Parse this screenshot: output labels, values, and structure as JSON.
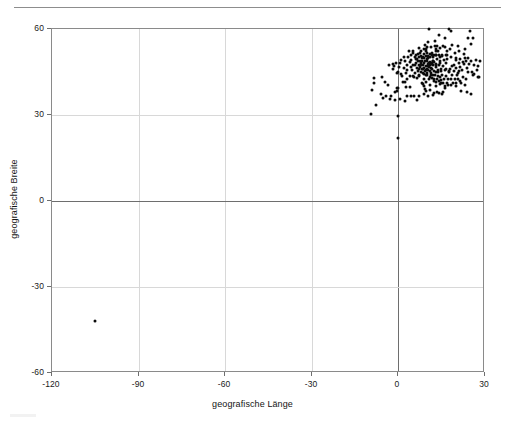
{
  "chart_data": {
    "type": "scatter",
    "title": "",
    "xlabel": "geografische Länge",
    "ylabel": "geografische Breite",
    "xlim": [
      -120,
      30
    ],
    "ylim": [
      -60,
      60
    ],
    "xticks": [
      -120,
      -90,
      -60,
      -30,
      0,
      30
    ],
    "yticks": [
      -60,
      -30,
      0,
      30,
      60
    ],
    "xticklabels": [
      "-120",
      "-90",
      "-60",
      "-30",
      "0",
      "30"
    ],
    "yticklabels": [
      "-60",
      "-30",
      "0",
      "30",
      "60"
    ],
    "grid": true,
    "legend": null,
    "marker": {
      "shape": "circle",
      "color": "#0b0b0b",
      "size": 3
    },
    "series": [
      {
        "name": "Fundorte",
        "points": [
          [
            -105.0,
            -42.0
          ],
          [
            0.0,
            29.5
          ],
          [
            0.0,
            22.0
          ],
          [
            26.0,
            57.0
          ],
          [
            3.5,
            52.3
          ],
          [
            13.0,
            52.5
          ],
          [
            12.3,
            51.0
          ],
          [
            11.0,
            50.2
          ],
          [
            9.5,
            50.6
          ],
          [
            8.6,
            50.1
          ],
          [
            10.0,
            49.5
          ],
          [
            12.0,
            49.0
          ],
          [
            14.4,
            50.1
          ],
          [
            7.6,
            49.0
          ],
          [
            8.2,
            48.8
          ],
          [
            6.1,
            49.6
          ],
          [
            9.2,
            48.8
          ],
          [
            10.9,
            48.4
          ],
          [
            11.6,
            48.1
          ],
          [
            13.0,
            47.8
          ],
          [
            14.3,
            48.2
          ],
          [
            16.4,
            48.2
          ],
          [
            15.4,
            47.1
          ],
          [
            8.5,
            47.4
          ],
          [
            7.4,
            46.9
          ],
          [
            6.6,
            46.5
          ],
          [
            9.0,
            46.5
          ],
          [
            11.3,
            46.5
          ],
          [
            12.3,
            45.4
          ],
          [
            9.2,
            45.5
          ],
          [
            7.7,
            45.1
          ],
          [
            10.0,
            44.5
          ],
          [
            11.3,
            44.5
          ],
          [
            12.6,
            43.8
          ],
          [
            11.3,
            43.8
          ],
          [
            9.4,
            44.1
          ],
          [
            8.9,
            44.4
          ],
          [
            13.8,
            45.1
          ],
          [
            16.0,
            45.8
          ],
          [
            17.6,
            44.9
          ],
          [
            18.4,
            43.9
          ],
          [
            19.2,
            45.2
          ],
          [
            20.5,
            44.8
          ],
          [
            21.0,
            45.3
          ],
          [
            22.0,
            45.8
          ],
          [
            23.6,
            46.5
          ],
          [
            24.0,
            45.0
          ],
          [
            25.6,
            45.0
          ],
          [
            26.1,
            44.4
          ],
          [
            23.3,
            42.7
          ],
          [
            21.4,
            42.0
          ],
          [
            19.8,
            41.3
          ],
          [
            21.7,
            41.1
          ],
          [
            22.9,
            40.6
          ],
          [
            23.7,
            37.9
          ],
          [
            21.7,
            38.2
          ],
          [
            25.3,
            37.4
          ],
          [
            14.3,
            40.8
          ],
          [
            15.6,
            41.1
          ],
          [
            16.9,
            41.1
          ],
          [
            12.5,
            41.9
          ],
          [
            13.4,
            42.4
          ],
          [
            14.2,
            42.0
          ],
          [
            15.1,
            37.5
          ],
          [
            13.4,
            38.1
          ],
          [
            12.5,
            37.8
          ],
          [
            9.1,
            39.2
          ],
          [
            8.6,
            40.7
          ],
          [
            4.0,
            39.9
          ],
          [
            2.6,
            39.6
          ],
          [
            0.0,
            39.5
          ],
          [
            -0.4,
            39.5
          ],
          [
            -1.1,
            38.0
          ],
          [
            -3.7,
            40.4
          ],
          [
            -4.7,
            41.6
          ],
          [
            -5.7,
            43.4
          ],
          [
            -8.5,
            42.9
          ],
          [
            -8.6,
            41.2
          ],
          [
            -9.1,
            38.7
          ],
          [
            -6.0,
            37.4
          ],
          [
            -4.4,
            36.7
          ],
          [
            -2.5,
            36.8
          ],
          [
            -0.5,
            38.3
          ],
          [
            1.5,
            41.4
          ],
          [
            2.2,
            41.4
          ],
          [
            3.1,
            42.5
          ],
          [
            1.4,
            43.6
          ],
          [
            -0.6,
            44.8
          ],
          [
            0.3,
            46.6
          ],
          [
            -1.6,
            47.2
          ],
          [
            2.3,
            48.9
          ],
          [
            4.8,
            45.8
          ],
          [
            5.4,
            43.3
          ],
          [
            7.3,
            43.7
          ],
          [
            4.4,
            50.8
          ],
          [
            4.9,
            52.4
          ],
          [
            5.1,
            51.6
          ],
          [
            6.8,
            51.2
          ],
          [
            7.6,
            51.5
          ],
          [
            6.0,
            50.8
          ],
          [
            8.7,
            51.3
          ],
          [
            9.7,
            52.4
          ],
          [
            10.0,
            53.6
          ],
          [
            11.4,
            53.6
          ],
          [
            12.6,
            54.1
          ],
          [
            13.4,
            54.1
          ],
          [
            8.8,
            53.1
          ],
          [
            7.2,
            53.5
          ],
          [
            9.9,
            51.5
          ],
          [
            11.0,
            51.3
          ],
          [
            12.9,
            50.8
          ],
          [
            14.0,
            51.1
          ],
          [
            15.0,
            51.1
          ],
          [
            16.9,
            52.4
          ],
          [
            17.0,
            51.1
          ],
          [
            19.5,
            51.8
          ],
          [
            21.0,
            52.2
          ],
          [
            18.6,
            54.4
          ],
          [
            20.5,
            53.9
          ],
          [
            22.6,
            51.2
          ],
          [
            23.0,
            53.1
          ],
          [
            24.0,
            49.8
          ],
          [
            25.3,
            54.7
          ],
          [
            24.1,
            56.9
          ],
          [
            24.8,
            59.4
          ],
          [
            18.1,
            59.3
          ],
          [
            10.7,
            59.9
          ],
          [
            10.4,
            55.4
          ],
          [
            12.6,
            55.7
          ],
          [
            14.2,
            57.8
          ],
          [
            16.0,
            56.7
          ],
          [
            17.6,
            59.9
          ],
          [
            11.0,
            47.5
          ],
          [
            11.9,
            47.3
          ],
          [
            13.1,
            47.5
          ],
          [
            14.1,
            47.5
          ],
          [
            10.2,
            47.2
          ],
          [
            9.4,
            47.1
          ],
          [
            8.0,
            47.6
          ],
          [
            7.0,
            47.6
          ],
          [
            10.6,
            46.9
          ],
          [
            12.9,
            46.6
          ],
          [
            11.6,
            46.1
          ],
          [
            10.4,
            45.6
          ],
          [
            9.7,
            45.7
          ],
          [
            8.2,
            45.9
          ],
          [
            6.9,
            45.2
          ],
          [
            5.9,
            44.6
          ],
          [
            7.0,
            44.1
          ],
          [
            10.8,
            43.4
          ],
          [
            12.1,
            44.1
          ],
          [
            13.6,
            43.6
          ],
          [
            15.0,
            44.1
          ],
          [
            16.4,
            43.5
          ],
          [
            17.1,
            42.7
          ],
          [
            18.1,
            42.4
          ],
          [
            19.5,
            42.4
          ],
          [
            20.7,
            42.6
          ],
          [
            22.3,
            43.3
          ],
          [
            20.4,
            43.9
          ],
          [
            17.9,
            46.2
          ],
          [
            19.1,
            47.5
          ],
          [
            20.1,
            46.3
          ],
          [
            21.3,
            46.8
          ],
          [
            22.8,
            47.7
          ],
          [
            24.5,
            47.8
          ],
          [
            26.2,
            47.6
          ],
          [
            27.6,
            47.2
          ],
          [
            25.9,
            43.9
          ],
          [
            27.5,
            43.2
          ],
          [
            28.0,
            43.4
          ],
          [
            8.3,
            50.0
          ],
          [
            9.0,
            49.8
          ],
          [
            10.4,
            49.8
          ],
          [
            11.9,
            50.3
          ],
          [
            13.3,
            49.7
          ],
          [
            12.1,
            48.8
          ],
          [
            10.6,
            48.2
          ],
          [
            9.8,
            48.8
          ],
          [
            8.9,
            48.3
          ],
          [
            7.8,
            48.1
          ],
          [
            6.9,
            48.7
          ],
          [
            6.2,
            48.0
          ],
          [
            5.0,
            47.3
          ],
          [
            3.9,
            48.4
          ],
          [
            2.9,
            47.3
          ],
          [
            1.9,
            46.3
          ],
          [
            3.1,
            45.8
          ],
          [
            4.4,
            46.9
          ],
          [
            5.7,
            47.6
          ],
          [
            7.0,
            50.4
          ],
          [
            8.0,
            52.2
          ],
          [
            9.1,
            54.3
          ],
          [
            11.5,
            50.9
          ],
          [
            13.8,
            52.4
          ],
          [
            15.5,
            54.2
          ],
          [
            17.0,
            49.6
          ],
          [
            15.8,
            49.2
          ],
          [
            14.5,
            49.0
          ],
          [
            13.0,
            51.1
          ],
          [
            11.0,
            45.4
          ],
          [
            12.3,
            42.5
          ],
          [
            14.8,
            42.1
          ],
          [
            16.2,
            39.3
          ],
          [
            17.2,
            40.5
          ],
          [
            18.2,
            40.3
          ],
          [
            15.3,
            38.0
          ],
          [
            13.9,
            37.6
          ],
          [
            12.1,
            36.9
          ],
          [
            10.2,
            36.8
          ],
          [
            8.9,
            37.3
          ],
          [
            7.0,
            36.8
          ],
          [
            5.4,
            36.7
          ],
          [
            3.1,
            36.8
          ],
          [
            0.5,
            35.7
          ],
          [
            -1.3,
            35.2
          ],
          [
            -3.0,
            35.6
          ],
          [
            -5.3,
            35.9
          ],
          [
            -7.6,
            33.6
          ],
          [
            -9.6,
            30.4
          ],
          [
            4.5,
            36.5
          ],
          [
            6.4,
            35.2
          ],
          [
            2.2,
            34.9
          ],
          [
            20.0,
            40.0
          ],
          [
            18.8,
            41.0
          ],
          [
            15.8,
            42.6
          ],
          [
            17.4,
            45.5
          ],
          [
            14.8,
            46.1
          ],
          [
            13.6,
            45.8
          ],
          [
            11.2,
            47.9
          ],
          [
            9.8,
            46.1
          ],
          [
            8.4,
            46.0
          ],
          [
            7.2,
            46.2
          ],
          [
            10.1,
            47.8
          ],
          [
            12.5,
            48.5
          ],
          [
            14.7,
            45.3
          ],
          [
            16.6,
            46.1
          ],
          [
            18.5,
            47.0
          ],
          [
            20.9,
            48.0
          ],
          [
            22.4,
            48.6
          ],
          [
            23.5,
            49.0
          ],
          [
            25.1,
            48.9
          ],
          [
            26.8,
            49.2
          ],
          [
            28.1,
            48.8
          ],
          [
            27.2,
            45.7
          ],
          [
            8.5,
            44.8
          ],
          [
            9.9,
            43.9
          ],
          [
            11.7,
            42.9
          ],
          [
            13.1,
            41.6
          ],
          [
            14.6,
            41.3
          ],
          [
            16.1,
            40.1
          ],
          [
            14.4,
            43.1
          ],
          [
            10.5,
            42.4
          ],
          [
            12.9,
            44.9
          ],
          [
            10.3,
            50.5
          ],
          [
            11.7,
            51.5
          ],
          [
            13.1,
            53.0
          ],
          [
            14.5,
            53.4
          ],
          [
            16.2,
            53.6
          ],
          [
            18.0,
            52.9
          ],
          [
            19.8,
            50.0
          ],
          [
            21.5,
            49.6
          ],
          [
            22.9,
            50.0
          ],
          [
            20.1,
            49.3
          ],
          [
            18.3,
            50.2
          ],
          [
            16.6,
            50.8
          ],
          [
            15.2,
            50.6
          ],
          [
            9.4,
            53.0
          ],
          [
            7.8,
            50.5
          ],
          [
            6.5,
            49.4
          ],
          [
            5.6,
            50.4
          ],
          [
            4.2,
            49.2
          ],
          [
            3.2,
            50.3
          ],
          [
            2.0,
            50.1
          ],
          [
            1.0,
            49.3
          ],
          [
            0.5,
            48.1
          ],
          [
            -0.8,
            48.2
          ],
          [
            -2.0,
            47.8
          ],
          [
            -3.2,
            47.6
          ],
          [
            -1.9,
            46.0
          ],
          [
            -0.3,
            45.1
          ],
          [
            0.9,
            44.2
          ],
          [
            2.5,
            44.5
          ],
          [
            3.9,
            43.7
          ],
          [
            5.1,
            43.5
          ],
          [
            6.4,
            42.9
          ],
          [
            8.8,
            42.5
          ],
          [
            9.5,
            41.5
          ],
          [
            8.1,
            41.2
          ],
          [
            9.0,
            40.0
          ],
          [
            11.1,
            40.4
          ],
          [
            12.9,
            40.2
          ],
          [
            10.8,
            38.8
          ],
          [
            9.6,
            38.2
          ]
        ]
      }
    ]
  },
  "axes": {
    "x_title": "geografische Länge",
    "y_title": "geografische Breite"
  }
}
